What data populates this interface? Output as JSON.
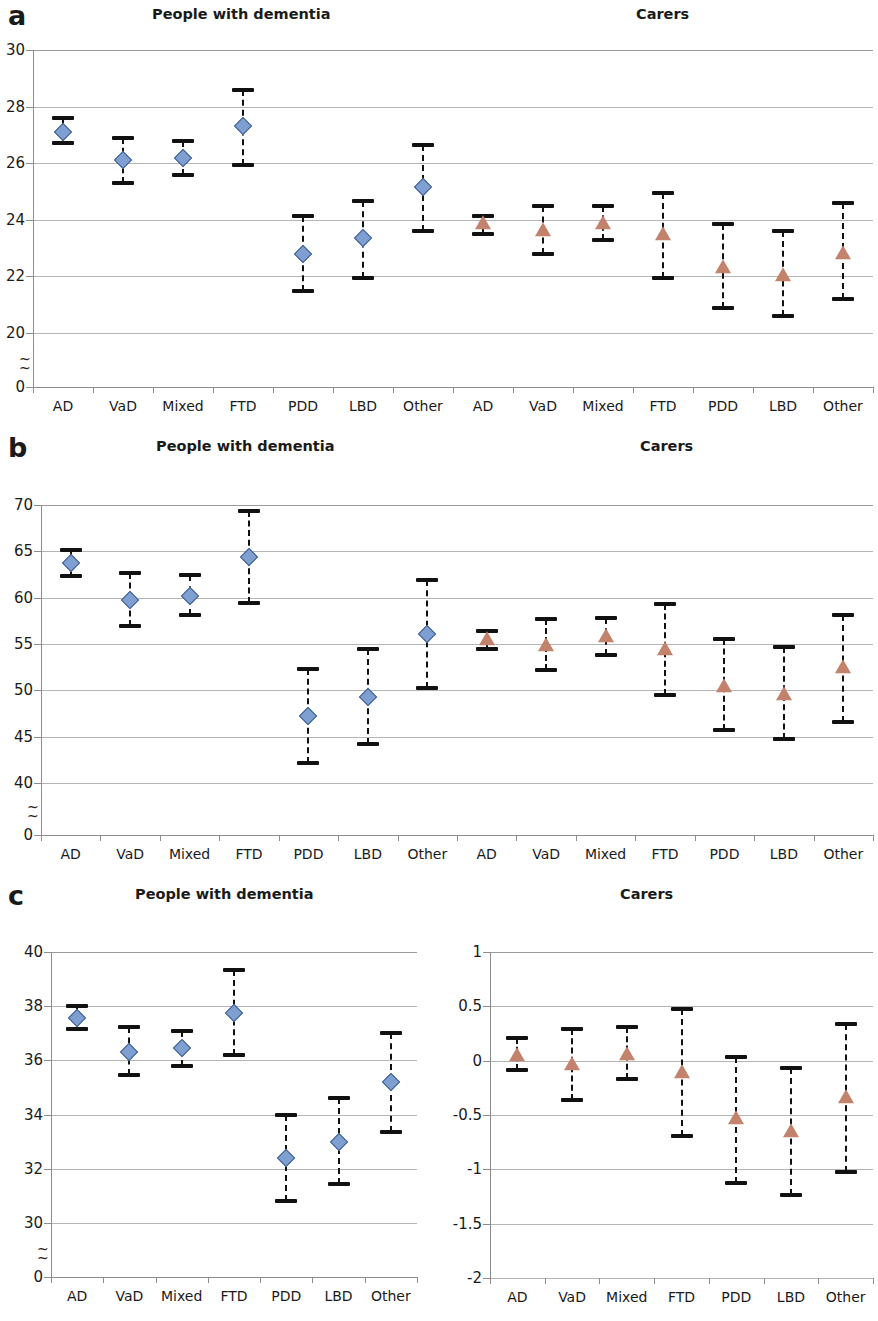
{
  "figure": {
    "panels": [
      {
        "letter": "a",
        "titles": {
          "left": "People with dementia",
          "right": "Carers"
        }
      },
      {
        "letter": "b",
        "titles": {
          "left": "People with dementia",
          "right": "Carers"
        }
      },
      {
        "letter": "c",
        "titles": {
          "left": "People with dementia",
          "right": "Carers"
        }
      }
    ]
  },
  "chart_data": [
    {
      "id": "panel-a",
      "type": "scatter",
      "title": "a",
      "subtitles": [
        "People with dementia",
        "Carers"
      ],
      "xlabel": "",
      "ylabel": "",
      "ylim": [
        0,
        30
      ],
      "y_ticks": [
        "30",
        "28",
        "26",
        "24",
        "22",
        "20",
        "0"
      ],
      "y_tick_values": [
        30,
        28,
        26,
        24,
        22,
        20,
        0
      ],
      "axis_break": true,
      "grid": true,
      "legend": "none",
      "categories": [
        "AD",
        "VaD",
        "Mixed",
        "FTD",
        "PDD",
        "LBD",
        "Other",
        "AD",
        "VaD",
        "Mixed",
        "FTD",
        "PDD",
        "LBD",
        "Other"
      ],
      "series": [
        {
          "name": "People with dementia",
          "marker": "diamond",
          "color": "#7f9fd0",
          "points": [
            {
              "category": "AD",
              "value": 27.1,
              "low": 26.7,
              "high": 27.6
            },
            {
              "category": "VaD",
              "value": 26.1,
              "low": 25.3,
              "high": 26.9
            },
            {
              "category": "Mixed",
              "value": 26.2,
              "low": 25.6,
              "high": 26.8
            },
            {
              "category": "FTD",
              "value": 27.3,
              "low": 25.95,
              "high": 28.6
            },
            {
              "category": "PDD",
              "value": 22.8,
              "low": 21.5,
              "high": 24.15
            },
            {
              "category": "LBD",
              "value": 23.35,
              "low": 21.95,
              "high": 24.65
            },
            {
              "category": "Other",
              "value": 25.15,
              "low": 23.6,
              "high": 26.65
            }
          ]
        },
        {
          "name": "Carers",
          "marker": "triangle",
          "color": "#c2826c",
          "points": [
            {
              "category": "AD",
              "value": 23.85,
              "low": 23.5,
              "high": 24.15
            },
            {
              "category": "VaD",
              "value": 23.6,
              "low": 22.8,
              "high": 24.5
            },
            {
              "category": "Mixed",
              "value": 23.85,
              "low": 23.3,
              "high": 24.5
            },
            {
              "category": "FTD",
              "value": 23.45,
              "low": 21.95,
              "high": 24.95
            },
            {
              "category": "PDD",
              "value": 22.3,
              "low": 20.9,
              "high": 23.85
            },
            {
              "category": "LBD",
              "value": 22.0,
              "low": 20.6,
              "high": 23.6
            },
            {
              "category": "Other",
              "value": 22.8,
              "low": 21.2,
              "high": 24.6
            }
          ]
        }
      ]
    },
    {
      "id": "panel-b",
      "type": "scatter",
      "title": "b",
      "subtitles": [
        "People with dementia",
        "Carers"
      ],
      "xlabel": "",
      "ylabel": "",
      "ylim": [
        0,
        70
      ],
      "y_ticks": [
        "70",
        "65",
        "60",
        "55",
        "50",
        "45",
        "40",
        "0"
      ],
      "y_tick_values": [
        70,
        65,
        60,
        55,
        50,
        45,
        40,
        0
      ],
      "axis_break": true,
      "grid": true,
      "legend": "none",
      "categories": [
        "AD",
        "VaD",
        "Mixed",
        "FTD",
        "PDD",
        "LBD",
        "Other",
        "AD",
        "VaD",
        "Mixed",
        "FTD",
        "PDD",
        "LBD",
        "Other"
      ],
      "series": [
        {
          "name": "People with dementia",
          "marker": "diamond",
          "color": "#7f9fd0",
          "points": [
            {
              "category": "AD",
              "value": 63.7,
              "low": 62.3,
              "high": 65.1
            },
            {
              "category": "VaD",
              "value": 59.8,
              "low": 56.9,
              "high": 62.7
            },
            {
              "category": "Mixed",
              "value": 60.2,
              "low": 58.1,
              "high": 62.4
            },
            {
              "category": "FTD",
              "value": 64.4,
              "low": 59.4,
              "high": 69.4
            },
            {
              "category": "PDD",
              "value": 47.2,
              "low": 42.2,
              "high": 52.3
            },
            {
              "category": "LBD",
              "value": 49.3,
              "low": 44.2,
              "high": 54.5
            },
            {
              "category": "Other",
              "value": 56.1,
              "low": 50.3,
              "high": 61.9
            }
          ]
        },
        {
          "name": "Carers",
          "marker": "triangle",
          "color": "#c2826c",
          "points": [
            {
              "category": "AD",
              "value": 55.4,
              "low": 54.5,
              "high": 56.4
            },
            {
              "category": "VaD",
              "value": 54.8,
              "low": 52.2,
              "high": 57.7
            },
            {
              "category": "Mixed",
              "value": 55.8,
              "low": 53.8,
              "high": 57.8
            },
            {
              "category": "FTD",
              "value": 54.3,
              "low": 49.5,
              "high": 59.3
            },
            {
              "category": "PDD",
              "value": 50.4,
              "low": 45.7,
              "high": 55.5
            },
            {
              "category": "LBD",
              "value": 49.5,
              "low": 44.8,
              "high": 54.7
            },
            {
              "category": "Other",
              "value": 52.4,
              "low": 46.6,
              "high": 58.1
            }
          ]
        }
      ]
    },
    {
      "id": "panel-c-left",
      "type": "scatter",
      "title": "c",
      "subtitles": [
        "People with dementia"
      ],
      "xlabel": "",
      "ylabel": "",
      "ylim": [
        0,
        40
      ],
      "y_ticks": [
        "40",
        "38",
        "36",
        "34",
        "32",
        "30",
        "0"
      ],
      "y_tick_values": [
        40,
        38,
        36,
        34,
        32,
        30,
        0
      ],
      "axis_break": true,
      "grid": true,
      "legend": "none",
      "categories": [
        "AD",
        "VaD",
        "Mixed",
        "FTD",
        "PDD",
        "LBD",
        "Other"
      ],
      "series": [
        {
          "name": "People with dementia",
          "marker": "diamond",
          "color": "#7f9fd0",
          "points": [
            {
              "category": "AD",
              "value": 37.55,
              "low": 37.15,
              "high": 38.0
            },
            {
              "category": "VaD",
              "value": 36.3,
              "low": 35.45,
              "high": 37.25
            },
            {
              "category": "Mixed",
              "value": 36.45,
              "low": 35.8,
              "high": 37.1
            },
            {
              "category": "FTD",
              "value": 37.75,
              "low": 36.2,
              "high": 39.35
            },
            {
              "category": "PDD",
              "value": 32.4,
              "low": 30.8,
              "high": 34.0
            },
            {
              "category": "LBD",
              "value": 33.0,
              "low": 31.45,
              "high": 34.6
            },
            {
              "category": "Other",
              "value": 35.2,
              "low": 33.35,
              "high": 37.0
            }
          ]
        }
      ]
    },
    {
      "id": "panel-c-right",
      "type": "scatter",
      "title": "c",
      "subtitles": [
        "Carers"
      ],
      "xlabel": "",
      "ylabel": "",
      "ylim": [
        -2,
        1
      ],
      "y_ticks": [
        "1",
        "0.5",
        "0",
        "-0.5",
        "-1",
        "-1.5",
        "-2"
      ],
      "y_tick_values": [
        1,
        0.5,
        0,
        -0.5,
        -1,
        -1.5,
        -2
      ],
      "axis_break": false,
      "grid": true,
      "legend": "none",
      "categories": [
        "AD",
        "VaD",
        "Mixed",
        "FTD",
        "PDD",
        "LBD",
        "Other"
      ],
      "series": [
        {
          "name": "Carers",
          "marker": "triangle",
          "color": "#c2826c",
          "points": [
            {
              "category": "AD",
              "value": 0.04,
              "low": -0.09,
              "high": 0.21
            },
            {
              "category": "VaD",
              "value": -0.04,
              "low": -0.36,
              "high": 0.29
            },
            {
              "category": "Mixed",
              "value": 0.05,
              "low": -0.17,
              "high": 0.31
            },
            {
              "category": "FTD",
              "value": -0.11,
              "low": -0.69,
              "high": 0.48
            },
            {
              "category": "PDD",
              "value": -0.54,
              "low": -1.13,
              "high": 0.03
            },
            {
              "category": "LBD",
              "value": -0.66,
              "low": -1.24,
              "high": -0.07
            },
            {
              "category": "Other",
              "value": -0.34,
              "low": -1.02,
              "high": 0.34
            }
          ]
        }
      ]
    }
  ],
  "colors": {
    "people_marker": "#7f9fd0",
    "people_marker_edge": "#3f5f93",
    "carer_marker": "#c2826c",
    "errorbar": "#111111",
    "gridline": "#9a9a9a",
    "axis": "#8d8d8d",
    "text": "#1a1a1a",
    "background": "#ffffff"
  }
}
